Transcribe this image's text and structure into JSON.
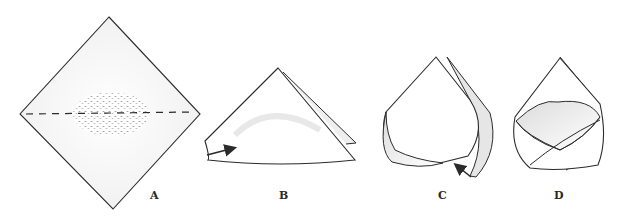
{
  "figure": {
    "panels": [
      {
        "id": "A",
        "label": "A",
        "description": "square napkin turned as diamond, rice mound in center, dashed horizontal fold line"
      },
      {
        "id": "B",
        "label": "B",
        "description": "napkin folded in half into triangle, arrow pointing at left corner"
      },
      {
        "id": "C",
        "label": "C",
        "description": "left corner folded across, arrow pointing at bottom overlap"
      },
      {
        "id": "D",
        "label": "D",
        "description": "both corners folded to form a closed pouch"
      }
    ],
    "colors": {
      "stroke": "#2b2b2b",
      "shade": "#cfcfcf",
      "background": "#ffffff"
    }
  }
}
